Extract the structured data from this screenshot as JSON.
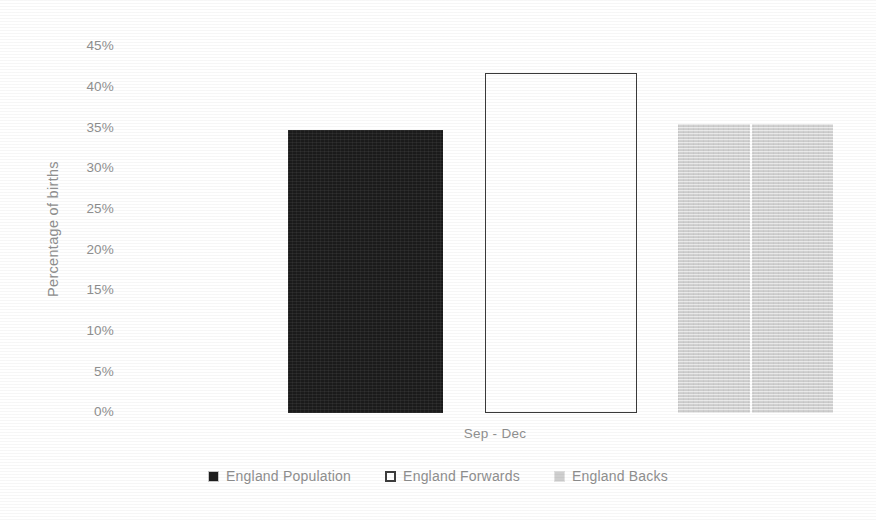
{
  "chart_data": {
    "type": "bar",
    "title": "",
    "subtitle": "",
    "xlabel": "",
    "ylabel": "Percentage of births",
    "categories": [
      "Sep - Dec"
    ],
    "series": [
      {
        "name": "England Population",
        "values": [
          33.3
        ],
        "color": "#1b1b1b",
        "style": "filled-dark"
      },
      {
        "name": "England Forwards",
        "values": [
          40.0
        ],
        "color": "#ffffff",
        "style": "outlined"
      },
      {
        "name": "England Backs",
        "values": [
          34.0
        ],
        "color": "#d2d2d2",
        "style": "filled-light"
      }
    ],
    "ylim": [
      0,
      45
    ],
    "ytick_values": [
      45,
      40,
      35,
      30,
      25,
      20,
      15,
      10,
      5,
      0
    ],
    "ytick_labels": [
      "45%",
      "40%",
      "35%",
      "30%",
      "25%",
      "20%",
      "15%",
      "10%",
      "5%",
      "0%"
    ],
    "grid": false,
    "legend_position": "bottom"
  },
  "axis": {
    "y_title": "Percentage of births",
    "ticks": [
      {
        "label": "45%",
        "value": 45
      },
      {
        "label": "40%",
        "value": 40
      },
      {
        "label": "35%",
        "value": 35
      },
      {
        "label": "30%",
        "value": 30
      },
      {
        "label": "25%",
        "value": 25
      },
      {
        "label": "20%",
        "value": 20
      },
      {
        "label": "15%",
        "value": 15
      },
      {
        "label": "10%",
        "value": 10
      },
      {
        "label": "5%",
        "value": 5
      },
      {
        "label": "0%",
        "value": 0
      }
    ],
    "category_label": "Sep - Dec"
  },
  "legend": {
    "items": [
      {
        "label": "England Population",
        "swatch": "filled-dark-square-icon"
      },
      {
        "label": "England Forwards",
        "swatch": "hollow-square-icon"
      },
      {
        "label": "England Backs",
        "swatch": "filled-light-square-icon"
      }
    ]
  }
}
